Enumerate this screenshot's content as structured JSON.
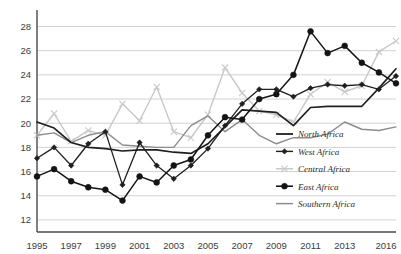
{
  "chart_data": {
    "type": "line",
    "title": "",
    "subtitle": "",
    "xlabel": "",
    "ylabel": "",
    "grid": "horizontal",
    "legend_position": "inside-right",
    "xlim": [
      1995,
      2016
    ],
    "ylim": [
      11,
      29.2
    ],
    "x": [
      1995,
      1996,
      1997,
      1998,
      1999,
      2000,
      2001,
      2002,
      2003,
      2004,
      2005,
      2006,
      2007,
      2008,
      2009,
      2010,
      2011,
      2012,
      2013,
      2014,
      2015,
      2016
    ],
    "xticks": [
      "1995",
      "1997",
      "1999",
      "2001",
      "2003",
      "2005",
      "2007",
      "2009",
      "2011",
      "2013",
      "2016"
    ],
    "xtick_values": [
      1995,
      1997,
      1999,
      2001,
      2003,
      2005,
      2007,
      2009,
      2011,
      2013,
      2016
    ],
    "yticks": [
      12,
      14,
      16,
      18,
      20,
      22,
      24,
      26,
      28
    ],
    "series": [
      {
        "name": "North Africa",
        "color": "#1f1f1f",
        "width": 1.7,
        "marker": "none",
        "values": [
          20.1,
          19.6,
          18.4,
          18.0,
          17.9,
          17.7,
          17.8,
          17.8,
          17.6,
          17.5,
          18.3,
          19.7,
          21.1,
          21.0,
          20.9,
          19.8,
          21.3,
          21.4,
          21.4,
          21.4,
          22.9,
          24.5
        ]
      },
      {
        "name": "West Africa",
        "color": "#1f1f1f",
        "width": 1.3,
        "marker": "diamond",
        "values": [
          17.1,
          18.0,
          16.5,
          18.3,
          19.3,
          14.9,
          18.4,
          16.5,
          15.4,
          16.5,
          17.9,
          19.8,
          21.6,
          22.8,
          22.8,
          22.2,
          22.9,
          23.2,
          23.1,
          23.2,
          22.8,
          23.9
        ]
      },
      {
        "name": "Central Africa",
        "color": "#c8c8c8",
        "width": 1.4,
        "marker": "x",
        "values": [
          19.0,
          20.8,
          18.5,
          19.4,
          19.0,
          21.6,
          20.2,
          23.0,
          19.3,
          18.8,
          20.7,
          24.6,
          22.5,
          21.0,
          20.7,
          20.1,
          22.4,
          23.4,
          22.6,
          23.1,
          25.9,
          26.8
        ]
      },
      {
        "name": "East Africa",
        "color": "#141414",
        "width": 1.5,
        "marker": "circle",
        "values": [
          15.6,
          16.2,
          15.2,
          14.7,
          14.5,
          13.6,
          15.6,
          15.1,
          16.5,
          17.0,
          19.0,
          20.5,
          20.3,
          22.0,
          22.4,
          24.0,
          27.6,
          25.8,
          26.4,
          25.0,
          24.2,
          23.3
        ]
      },
      {
        "name": "Southern Africa",
        "color": "#8c8c8c",
        "width": 1.4,
        "marker": "none",
        "values": [
          19.0,
          19.2,
          18.4,
          19.0,
          19.3,
          18.2,
          18.1,
          18.0,
          18.0,
          19.8,
          20.6,
          19.3,
          20.3,
          19.0,
          18.3,
          18.8,
          18.8,
          19.1,
          20.1,
          19.5,
          19.4,
          19.7
        ]
      }
    ],
    "legend": [
      {
        "label": "North Africa",
        "color": "#1f1f1f",
        "marker": "none",
        "width": 1.8
      },
      {
        "label": "West Africa",
        "color": "#1f1f1f",
        "marker": "diamond",
        "width": 1.4
      },
      {
        "label": "Central Africa",
        "color": "#c8c8c8",
        "marker": "x",
        "width": 1.5
      },
      {
        "label": "East Africa",
        "color": "#141414",
        "marker": "circle",
        "width": 1.6
      },
      {
        "label": "Southern Africa",
        "color": "#8c8c8c",
        "marker": "none",
        "width": 1.5
      }
    ]
  }
}
